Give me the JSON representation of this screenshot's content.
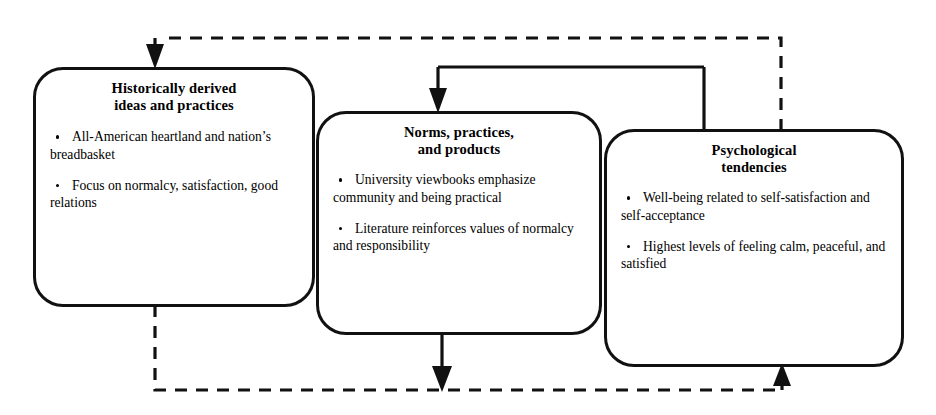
{
  "diagram": {
    "type": "flow",
    "background_color": "#ffffff",
    "line_color": "#111111",
    "nodes": [
      {
        "id": "historically-derived-ideas-and-practices",
        "title": "Historically derived\nideas and practices",
        "bullets": [
          "All-American heartland and nation’s breadbasket",
          "Focus on normalcy, satisfaction, good relations"
        ]
      },
      {
        "id": "norms-practices-and-products",
        "title": "Norms, practices,\nand products",
        "bullets": [
          "University viewbooks emphasize community and being practical",
          "Literature reinforces values of normalcy and responsibility"
        ]
      },
      {
        "id": "psychological-tendencies",
        "title": "Psychological\ntendencies",
        "bullets": [
          "Well-being related to self-satisfaction and self-acceptance",
          "Highest levels of feeling calm, peaceful, and satisfied"
        ]
      }
    ],
    "connectors": [
      {
        "id": "box1-top-to-box2-top",
        "style": "solid",
        "from": "historically-derived-ideas-and-practices",
        "to": "norms-practices-and-products",
        "arrow": "down"
      },
      {
        "id": "box2-top-to-box3-top",
        "style": "solid",
        "from": "norms-practices-and-products",
        "to": "psychological-tendencies",
        "arrow": "none"
      },
      {
        "id": "box2-bottom-down",
        "style": "solid",
        "from": "norms-practices-and-products",
        "to": "bottom-feedback-line",
        "arrow": "down"
      },
      {
        "id": "feedback-top-into-box1",
        "style": "dashed",
        "from": "psychological-tendencies",
        "to": "historically-derived-ideas-and-practices",
        "arrow": "down"
      },
      {
        "id": "feedback-bottom-into-box3",
        "style": "dashed",
        "from": "historically-derived-ideas-and-practices",
        "to": "psychological-tendencies",
        "arrow": "up"
      }
    ]
  }
}
